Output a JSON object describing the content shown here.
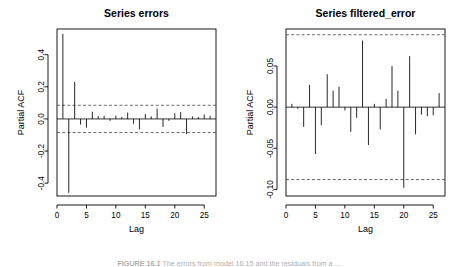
{
  "figure": {
    "caption_prefix": "FIGURE 16.1",
    "caption_text": "The errors from model 16.15 and the residuals from a ..."
  },
  "chart_data": [
    {
      "type": "bar",
      "title": "Series errors",
      "xlabel": "Lag",
      "ylabel": "Partial ACF",
      "xlim": [
        0,
        27
      ],
      "ylim": [
        -0.48,
        0.56
      ],
      "xticks": [
        0,
        5,
        10,
        15,
        20,
        25
      ],
      "yticks": [
        -0.4,
        -0.2,
        0.0,
        0.2,
        0.4
      ],
      "ytick_labels": [
        "-0.4",
        "-0.2",
        "0.0",
        "0.2",
        "0.4"
      ],
      "xtick_labels": [
        "0",
        "5",
        "10",
        "15",
        "20",
        "25"
      ],
      "grid": false,
      "legend": "none",
      "confidence_bounds": [
        0.085,
        -0.085
      ],
      "x": [
        1,
        2,
        3,
        4,
        5,
        6,
        7,
        8,
        9,
        10,
        11,
        12,
        13,
        14,
        15,
        16,
        17,
        18,
        19,
        20,
        21,
        22,
        23,
        24,
        25,
        26
      ],
      "values": [
        0.53,
        -0.46,
        0.23,
        -0.035,
        -0.055,
        0.045,
        0.018,
        0.02,
        -0.012,
        0.02,
        0.012,
        0.04,
        -0.03,
        -0.065,
        0.03,
        0.016,
        0.065,
        -0.05,
        -0.012,
        0.035,
        0.042,
        -0.095,
        0.016,
        0.012,
        0.028,
        0.02
      ]
    },
    {
      "type": "bar",
      "title": "Series filtered_error",
      "xlabel": "Lag",
      "ylabel": "Partial ACF",
      "xlim": [
        0,
        27
      ],
      "ylim": [
        -0.108,
        0.095
      ],
      "xticks": [
        0,
        5,
        10,
        15,
        20,
        25
      ],
      "yticks": [
        -0.1,
        -0.05,
        0.0,
        0.05
      ],
      "ytick_labels": [
        "-0.10",
        "-0.05",
        "0.00",
        "0.05"
      ],
      "xtick_labels": [
        "0",
        "5",
        "10",
        "15",
        "20",
        "25"
      ],
      "grid": false,
      "legend": "none",
      "confidence_bounds": [
        0.088,
        -0.088
      ],
      "x": [
        1,
        2,
        3,
        4,
        5,
        6,
        7,
        8,
        9,
        10,
        11,
        12,
        13,
        14,
        15,
        16,
        17,
        18,
        19,
        20,
        21,
        22,
        23,
        24,
        25,
        26
      ],
      "values": [
        0.004,
        -0.002,
        -0.024,
        0.027,
        -0.057,
        -0.022,
        0.04,
        0.02,
        0.025,
        -0.004,
        -0.03,
        -0.013,
        0.081,
        -0.046,
        0.004,
        -0.027,
        0.01,
        0.05,
        0.02,
        -0.098,
        0.062,
        -0.033,
        -0.009,
        -0.011,
        -0.01,
        0.017
      ]
    }
  ]
}
